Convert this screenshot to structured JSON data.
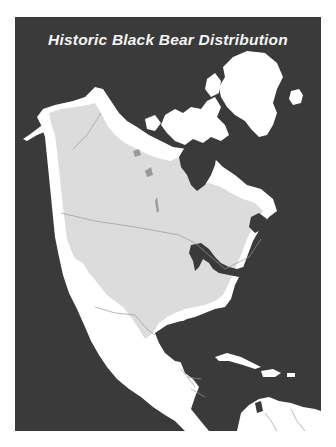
{
  "map": {
    "title": "Historic Black Bear Distribution",
    "colors": {
      "background": "#3a3a3a",
      "land": "#ffffff",
      "historic_range": "#dcdcdc",
      "water": "#3a3a3a",
      "borders": "#9a9a9a"
    },
    "regions": [
      {
        "name": "Alaska",
        "in_range": true
      },
      {
        "name": "Canada",
        "in_range": true
      },
      {
        "name": "Canadian Arctic Archipelago",
        "in_range": false
      },
      {
        "name": "Greenland",
        "in_range": false
      },
      {
        "name": "Iceland",
        "in_range": false
      },
      {
        "name": "United States",
        "in_range": true
      },
      {
        "name": "Northern Mexico",
        "in_range": true
      },
      {
        "name": "Southern Mexico",
        "in_range": false
      },
      {
        "name": "Central America",
        "in_range": false
      },
      {
        "name": "Caribbean Islands",
        "in_range": false
      },
      {
        "name": "Northern South America",
        "in_range": false
      }
    ]
  }
}
